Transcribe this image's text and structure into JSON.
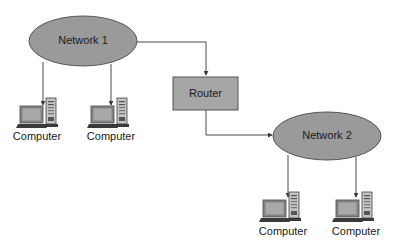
{
  "diagram": {
    "type": "network-topology",
    "colors": {
      "network_fill": "#9a9a9a",
      "router_fill": "#a6a6a6",
      "stroke": "#555555",
      "line": "#4a4a4a",
      "background": "#ffffff"
    },
    "networks": [
      {
        "id": "network1",
        "label": "Network 1"
      },
      {
        "id": "network2",
        "label": "Network 2"
      }
    ],
    "router": {
      "label": "Router"
    },
    "computers": [
      {
        "label": "Computer",
        "network": "network1"
      },
      {
        "label": "Computer",
        "network": "network1"
      },
      {
        "label": "Computer",
        "network": "network2"
      },
      {
        "label": "Computer",
        "network": "network2"
      }
    ],
    "edges": [
      {
        "from": "network1",
        "to": "router"
      },
      {
        "from": "router",
        "to": "network2"
      },
      {
        "from": "network1",
        "to": "computer1"
      },
      {
        "from": "network1",
        "to": "computer2"
      },
      {
        "from": "network2",
        "to": "computer3"
      },
      {
        "from": "network2",
        "to": "computer4"
      }
    ]
  }
}
